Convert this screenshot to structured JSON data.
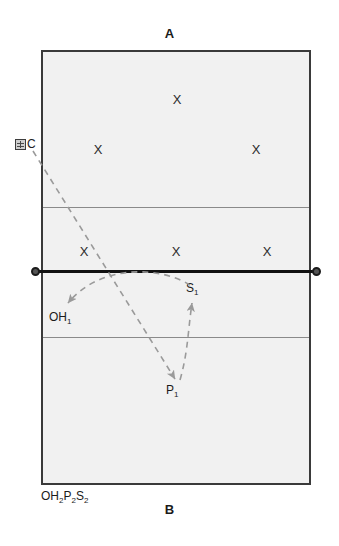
{
  "diagram": {
    "title_top": "A",
    "title_bottom": "B",
    "bench_label": "OH₂P₂S₂",
    "coach": {
      "icon_name": "coach-box-icon",
      "label": "C"
    },
    "court": {
      "fill_color": "#f1f1f1",
      "border_color": "#3a3a3a",
      "attack_line_color": "#8a8a8a"
    },
    "net": {
      "color": "#111111",
      "post_color": "#555555"
    },
    "arrow_color": "#9a9a9a"
  },
  "players": {
    "mark": "X",
    "opponents": [
      {
        "name": "opponent-back-center",
        "label": "X",
        "x": 177,
        "y": 99
      },
      {
        "name": "opponent-back-left",
        "label": "X",
        "x": 98,
        "y": 149
      },
      {
        "name": "opponent-back-right",
        "label": "X",
        "x": 256,
        "y": 149
      },
      {
        "name": "opponent-front-left",
        "label": "X",
        "x": 84,
        "y": 251
      },
      {
        "name": "opponent-front-center",
        "label": "X",
        "x": 176,
        "y": 251
      },
      {
        "name": "opponent-front-right",
        "label": "X",
        "x": 267,
        "y": 251
      }
    ]
  },
  "positions": {
    "setter": "S₁",
    "outside_hitter": "OH₁",
    "passer": "P₁"
  },
  "paths": [
    {
      "name": "coach-toss-to-passer",
      "from": "C",
      "to": "P₁"
    },
    {
      "name": "pass-to-setter",
      "from": "P₁",
      "to": "S₁"
    },
    {
      "name": "set-to-outside-hitter",
      "from": "S₁",
      "to": "OH₁"
    }
  ]
}
